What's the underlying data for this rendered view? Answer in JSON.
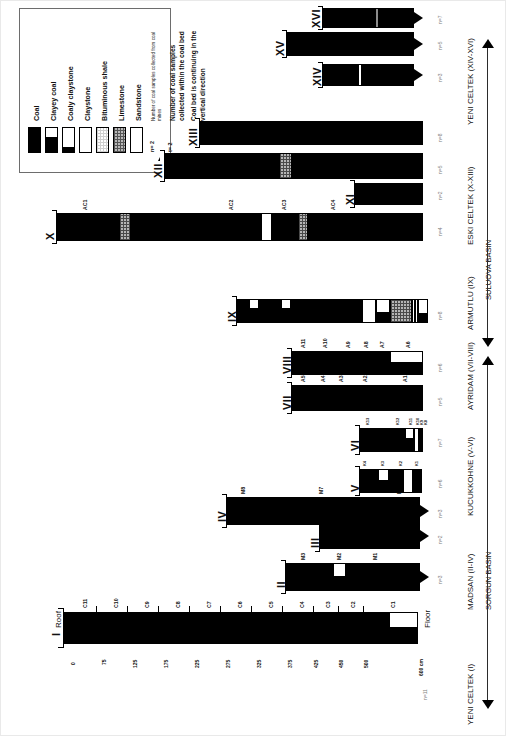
{
  "figure": {
    "orientation": "rotated-90"
  },
  "legend": {
    "title": "",
    "lithologies": [
      {
        "key": "coal",
        "label": "Coal"
      },
      {
        "key": "clayey-coal",
        "label": "Clayey coal"
      },
      {
        "key": "coaly-claystone",
        "label": "Coaly claystone"
      },
      {
        "key": "claystone",
        "label": "Claystone"
      },
      {
        "key": "bituminous-shale",
        "label": "Bituminous shale"
      },
      {
        "key": "limestone",
        "label": "Limestone"
      },
      {
        "key": "sandstone",
        "label": "Sandstone"
      }
    ],
    "symbols": [
      {
        "key": "n-symbol",
        "mark": "n= 2",
        "text": "Number of coal samples collected from coal mines"
      },
      {
        "key": "t-symbol",
        "mark": "t= 2",
        "text": "Number of coal samples collected within the coal bed"
      },
      {
        "key": "arrow-symbol",
        "mark": "",
        "text": "Coal bed is continuing in the vertical direction"
      }
    ]
  },
  "scale": {
    "unit": "cm",
    "roof_label": "Roof",
    "floor_label": "Floor",
    "ticks": [
      "0",
      "75",
      "125",
      "175",
      "225",
      "275",
      "325",
      "375",
      "425",
      "450",
      "500",
      "600 cm"
    ],
    "sample_labels": [
      "C11",
      "C10",
      "C9",
      "C8",
      "C7",
      "C6",
      "C5",
      "C4",
      "C3",
      "C2",
      "C1"
    ]
  },
  "columns": [
    {
      "id": "I",
      "roman": "I",
      "n": "n=11",
      "samples": [
        "C11",
        "C10",
        "C9",
        "C8",
        "C7",
        "C6",
        "C5",
        "C4",
        "C3",
        "C2",
        "C1"
      ],
      "continues": false
    },
    {
      "id": "II",
      "roman": "II",
      "n": "n=3",
      "samples": [
        "M3",
        "M2",
        "M1"
      ],
      "continues": true
    },
    {
      "id": "III",
      "roman": "III",
      "n": "n=2",
      "samples": [
        "M4",
        "M5"
      ],
      "continues": true
    },
    {
      "id": "IV",
      "roman": "IV",
      "n": "n=3",
      "samples": [
        "M8",
        "M7",
        "M6"
      ],
      "continues": true
    },
    {
      "id": "V",
      "roman": "V",
      "n": "n=6",
      "samples": [
        "K7",
        "K6",
        "K5",
        "K4",
        "K3",
        "K2",
        "K1"
      ],
      "continues": false
    },
    {
      "id": "VI",
      "roman": "VI",
      "n": "n=7",
      "samples": [
        "K13",
        "K12",
        "K11",
        "K10",
        "K9",
        "K8",
        "K7"
      ],
      "continues": false
    },
    {
      "id": "VII",
      "roman": "VII",
      "n": "n=5",
      "samples": [
        "A5",
        "A4",
        "A3",
        "A2",
        "A1"
      ],
      "continues": false
    },
    {
      "id": "VIII",
      "roman": "VIII",
      "n": "n=6",
      "samples": [
        "A11",
        "A10",
        "A9",
        "A8",
        "A7",
        "A6"
      ],
      "continues": false
    },
    {
      "id": "IX",
      "roman": "IX",
      "n": "n=8",
      "samples": [],
      "continues": false
    },
    {
      "id": "X",
      "roman": "X",
      "n": "n=4",
      "samples": [
        "AC1",
        "AC2",
        "AC3",
        "AC4"
      ],
      "continues": false
    },
    {
      "id": "XI",
      "roman": "XI",
      "n": "n=2",
      "samples": [],
      "continues": false
    },
    {
      "id": "XII",
      "roman": "XII",
      "n": "n=5",
      "samples": [],
      "continues": false
    },
    {
      "id": "XIII",
      "roman": "XIII",
      "n": "n=8",
      "samples": [],
      "continues": false
    },
    {
      "id": "XIV",
      "roman": "XIV",
      "n": "n=3",
      "samples": [],
      "continues": true
    },
    {
      "id": "XV",
      "roman": "XV",
      "n": "n=5",
      "samples": [],
      "continues": true
    },
    {
      "id": "XVI",
      "roman": "XVI",
      "n": "n=7",
      "samples": [],
      "continues": true
    }
  ],
  "mines": [
    {
      "key": "yeni-celtek-1",
      "label": "YENI CELTEK (I)"
    },
    {
      "key": "madsan",
      "label": "MADSAN (II-IV)"
    },
    {
      "key": "kucukkohne",
      "label": "KUCUKKOHNE (V-VI)"
    },
    {
      "key": "ayridam",
      "label": "AYRIDAM (VII-VIII)"
    },
    {
      "key": "armutlu",
      "label": "ARMUTLU (IX)"
    },
    {
      "key": "eski-celtek",
      "label": "ESKI CELTEK (X-XIII)"
    },
    {
      "key": "yeni-celtek-2",
      "label": "YENI CELTEK (XIV-XVI)"
    }
  ],
  "basins": [
    {
      "key": "sorgun",
      "label": "SORGUN BASIN"
    },
    {
      "key": "suluova",
      "label": "SULUOVA BASIN"
    }
  ],
  "colors": {
    "coal": "#000000",
    "claystone": "#ffffff",
    "limestone": "#b5b5b5",
    "bituminous": "#d2d2d2",
    "outline": "#000000",
    "gray_band": "#8c8c8c"
  }
}
